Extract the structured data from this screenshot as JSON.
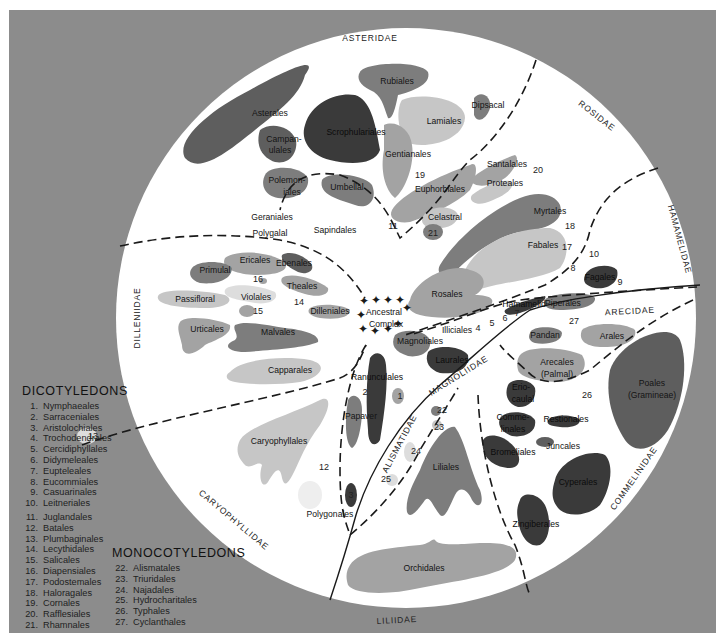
{
  "figure": {
    "background_color": "#8c8c8c",
    "circle_color": "#ffffff",
    "shade_colors": {
      "dark": "#3a3a3a",
      "mid_dark": "#5e5e5e",
      "mid": "#7d7d7d",
      "light": "#a3a3a3",
      "pale": "#c6c6c6",
      "faint": "#dddddd"
    }
  },
  "subclasses": [
    {
      "name": "ASTERIDAE",
      "x": 370,
      "y": 41,
      "rotate": 0
    },
    {
      "name": "ROSIDAE",
      "x": 595,
      "y": 118,
      "rotate": 38
    },
    {
      "name": "HAMAMELIDAE",
      "x": 677,
      "y": 240,
      "rotate": 75
    },
    {
      "name": "DILLENIIDAE",
      "x": 140,
      "y": 318,
      "rotate": -90
    },
    {
      "name": "ARECIDAE",
      "x": 630,
      "y": 314,
      "rotate": -3
    },
    {
      "name": "MAGNOLIIDAE",
      "x": 460,
      "y": 378,
      "rotate": -32
    },
    {
      "name": "ALISMATIDAE",
      "x": 402,
      "y": 445,
      "rotate": -62
    },
    {
      "name": "COMMELINIDAE",
      "x": 636,
      "y": 480,
      "rotate": -55
    },
    {
      "name": "CARYOPHYLLIDAE",
      "x": 232,
      "y": 522,
      "rotate": 40
    },
    {
      "name": "LILIIDAE",
      "x": 397,
      "y": 623,
      "rotate": -3
    }
  ],
  "orders": [
    {
      "label": "Asterales",
      "x": 270,
      "y": 113,
      "shade": "mid_dark"
    },
    {
      "label": "Rubiales",
      "x": 397,
      "y": 81,
      "shade": "mid"
    },
    {
      "label": "Dipsacal",
      "x": 488,
      "y": 105,
      "shade": "mid"
    },
    {
      "label": "Lamiales",
      "x": 444,
      "y": 121,
      "shade": "pale"
    },
    {
      "label": "Scrophulariales",
      "x": 356,
      "y": 132,
      "shade": "dark"
    },
    {
      "label": "Campan-",
      "x": 284,
      "y": 139,
      "shade": "mid_dark"
    },
    {
      "label": "ulales",
      "x": 280,
      "y": 150,
      "shade": "mid_dark"
    },
    {
      "label": "Gentianales",
      "x": 408,
      "y": 154,
      "shade": "light"
    },
    {
      "label": "Polemon-",
      "x": 287,
      "y": 180,
      "shade": "mid"
    },
    {
      "label": "iales",
      "x": 292,
      "y": 192,
      "shade": "mid"
    },
    {
      "label": "Umbellal",
      "x": 347,
      "y": 187,
      "shade": "mid"
    },
    {
      "label": "Santalales",
      "x": 507,
      "y": 164,
      "shade": "light"
    },
    {
      "label": "Proteales",
      "x": 505,
      "y": 183,
      "shade": "pale"
    },
    {
      "label": "Euphorbiales",
      "x": 440,
      "y": 189,
      "shade": "light"
    },
    {
      "label": "Myrtales",
      "x": 550,
      "y": 211,
      "shade": "mid"
    },
    {
      "label": "Geraniales",
      "x": 272,
      "y": 217,
      "shade": "pale"
    },
    {
      "label": "Celastral",
      "x": 445,
      "y": 217,
      "shade": "pale"
    },
    {
      "label": "Sapindales",
      "x": 335,
      "y": 230,
      "shade": "light"
    },
    {
      "label": "Polygalal",
      "x": 270,
      "y": 233,
      "shade": "mid"
    },
    {
      "label": "Fabales",
      "x": 543,
      "y": 245,
      "shade": "pale"
    },
    {
      "label": "Ericales",
      "x": 255,
      "y": 260,
      "shade": "light"
    },
    {
      "label": "Primulal",
      "x": 215,
      "y": 270,
      "shade": "mid"
    },
    {
      "label": "Ebenales",
      "x": 294,
      "y": 263,
      "shade": "mid_dark"
    },
    {
      "label": "Theales",
      "x": 302,
      "y": 286,
      "shade": "light"
    },
    {
      "label": "Passifloral",
      "x": 195,
      "y": 299,
      "shade": "pale"
    },
    {
      "label": "Violales",
      "x": 256,
      "y": 297,
      "shade": "faint"
    },
    {
      "label": "Dilleniales",
      "x": 330,
      "y": 311,
      "shade": "light"
    },
    {
      "label": "Urticales",
      "x": 207,
      "y": 329,
      "shade": "light"
    },
    {
      "label": "Malvales",
      "x": 278,
      "y": 332,
      "shade": "mid"
    },
    {
      "label": "Rosales",
      "x": 447,
      "y": 294,
      "shade": "light"
    },
    {
      "label": "Fagales",
      "x": 600,
      "y": 277,
      "shade": "dark"
    },
    {
      "label": "Piperales",
      "x": 563,
      "y": 303,
      "shade": "mid"
    },
    {
      "label": "Capparales",
      "x": 290,
      "y": 370,
      "shade": "pale"
    },
    {
      "label": "Illiciales",
      "x": 457,
      "y": 330,
      "shade": "mid"
    },
    {
      "label": "Magnoliales",
      "x": 420,
      "y": 341,
      "shade": "mid"
    },
    {
      "label": "Laurales",
      "x": 452,
      "y": 360,
      "shade": "dark"
    },
    {
      "label": "Pandan",
      "x": 545,
      "y": 335,
      "shade": "mid"
    },
    {
      "label": "Arales",
      "x": 612,
      "y": 336,
      "shade": "light"
    },
    {
      "label": "Arecales",
      "x": 557,
      "y": 362,
      "shade": "light"
    },
    {
      "label": "(Palmal)",
      "x": 557,
      "y": 374,
      "shade": "light"
    },
    {
      "label": "Ranunculales",
      "x": 377,
      "y": 377,
      "shade": "dark"
    },
    {
      "label": "Papaver",
      "x": 361,
      "y": 416,
      "shade": "mid"
    },
    {
      "label": "Erio-",
      "x": 521,
      "y": 387,
      "shade": "dark"
    },
    {
      "label": "caulal",
      "x": 523,
      "y": 399,
      "shade": "dark"
    },
    {
      "label": "Poales",
      "x": 652,
      "y": 383,
      "shade": "mid_dark"
    },
    {
      "label": "(Gramineae)",
      "x": 652,
      "y": 395,
      "shade": "mid_dark"
    },
    {
      "label": "Comme-",
      "x": 513,
      "y": 417,
      "shade": "dark"
    },
    {
      "label": "linales",
      "x": 513,
      "y": 429,
      "shade": "dark"
    },
    {
      "label": "Restionales",
      "x": 566,
      "y": 419,
      "shade": "dark"
    },
    {
      "label": "Juncales",
      "x": 563,
      "y": 446,
      "shade": "mid_dark"
    },
    {
      "label": "Caryophyllales",
      "x": 279,
      "y": 441,
      "shade": "pale"
    },
    {
      "label": "Liliales",
      "x": 446,
      "y": 467,
      "shade": "mid"
    },
    {
      "label": "Bromeliales",
      "x": 513,
      "y": 452,
      "shade": "dark"
    },
    {
      "label": "Cyperales",
      "x": 578,
      "y": 482,
      "shade": "dark"
    },
    {
      "label": "Polygonales",
      "x": 330,
      "y": 514,
      "shade": "faint"
    },
    {
      "label": "Zingiberales",
      "x": 536,
      "y": 524,
      "shade": "dark"
    },
    {
      "label": "Orchidales",
      "x": 424,
      "y": 568,
      "shade": "light"
    },
    {
      "label": "Hamamelid",
      "x": 524,
      "y": 304,
      "shade": "dark"
    },
    {
      "label": "Ancestral",
      "x": 384,
      "y": 312,
      "shade": "none"
    },
    {
      "label": "Complex",
      "x": 386,
      "y": 324,
      "shade": "none"
    }
  ],
  "numbered_markers": [
    {
      "n": "1",
      "x": 400,
      "y": 396
    },
    {
      "n": "2",
      "x": 365,
      "y": 392
    },
    {
      "n": "3",
      "x": 351,
      "y": 495
    },
    {
      "n": "4",
      "x": 478,
      "y": 328
    },
    {
      "n": "5",
      "x": 492,
      "y": 323
    },
    {
      "n": "6",
      "x": 505,
      "y": 318
    },
    {
      "n": "7",
      "x": 517,
      "y": 313
    },
    {
      "n": "8",
      "x": 573,
      "y": 268
    },
    {
      "n": "9",
      "x": 620,
      "y": 282
    },
    {
      "n": "10",
      "x": 594,
      "y": 254
    },
    {
      "n": "11",
      "x": 393,
      "y": 226
    },
    {
      "n": "12",
      "x": 324,
      "y": 467
    },
    {
      "n": "13",
      "x": 93,
      "y": 436
    },
    {
      "n": "14",
      "x": 299,
      "y": 302
    },
    {
      "n": "15",
      "x": 258,
      "y": 311
    },
    {
      "n": "16",
      "x": 258,
      "y": 279
    },
    {
      "n": "17",
      "x": 567,
      "y": 247
    },
    {
      "n": "18",
      "x": 570,
      "y": 226
    },
    {
      "n": "19",
      "x": 420,
      "y": 175
    },
    {
      "n": "20",
      "x": 538,
      "y": 170
    },
    {
      "n": "21",
      "x": 433,
      "y": 233
    },
    {
      "n": "22",
      "x": 442,
      "y": 410
    },
    {
      "n": "23",
      "x": 439,
      "y": 427
    },
    {
      "n": "24",
      "x": 416,
      "y": 451
    },
    {
      "n": "25",
      "x": 386,
      "y": 479
    },
    {
      "n": "26",
      "x": 587,
      "y": 395
    },
    {
      "n": "27",
      "x": 574,
      "y": 321
    }
  ],
  "legend": {
    "dicots": {
      "title": "DICOTYLEDONS",
      "items": [
        {
          "num": "1.",
          "name": "Nymphaeales"
        },
        {
          "num": "2.",
          "name": "Sarraceniales"
        },
        {
          "num": "3.",
          "name": "Aristolochiales"
        },
        {
          "num": "4.",
          "name": "Trochodendrales"
        },
        {
          "num": "5.",
          "name": "Cercidiphyllales"
        },
        {
          "num": "6.",
          "name": "Didymeleales"
        },
        {
          "num": "7.",
          "name": "Eupteleales"
        },
        {
          "num": "8.",
          "name": "Eucommiales"
        },
        {
          "num": "9.",
          "name": "Casuarinales"
        },
        {
          "num": "10.",
          "name": "Leitneriales"
        },
        {
          "num": "11.",
          "name": "Juglandales"
        },
        {
          "num": "12.",
          "name": "Batales"
        },
        {
          "num": "13.",
          "name": "Plumbaginales"
        },
        {
          "num": "14.",
          "name": "Lecythidales"
        },
        {
          "num": "15.",
          "name": "Salicales"
        },
        {
          "num": "16.",
          "name": "Diapensiales"
        },
        {
          "num": "17.",
          "name": "Podostemales"
        },
        {
          "num": "18.",
          "name": "Haloragales"
        },
        {
          "num": "19.",
          "name": "Cornales"
        },
        {
          "num": "20.",
          "name": "Rafflesiales"
        },
        {
          "num": "21.",
          "name": "Rhamnales"
        }
      ]
    },
    "monocots": {
      "title": "MONOCOTYLEDONS",
      "items": [
        {
          "num": "22.",
          "name": "Alismatales"
        },
        {
          "num": "23.",
          "name": "Triuridales"
        },
        {
          "num": "24.",
          "name": "Najadales"
        },
        {
          "num": "25.",
          "name": "Hydrocharitales"
        },
        {
          "num": "26.",
          "name": "Typhales"
        },
        {
          "num": "27.",
          "name": "Cyclanthales"
        }
      ]
    }
  }
}
